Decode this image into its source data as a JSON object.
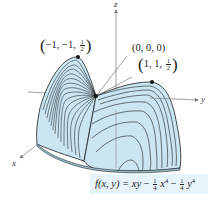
{
  "figure": {
    "type": "3d-surface",
    "surface_fill": "#c9e6f2",
    "contour_color": "#1c1c1c",
    "axis_color": "#777777",
    "axes": {
      "x_label": "x",
      "y_label": "y",
      "z_label": "z"
    },
    "points": [
      {
        "name": "max-left",
        "coords": [
          "−1",
          "−1"
        ],
        "z_num": "1",
        "z_den": "2"
      },
      {
        "name": "origin",
        "label": "(0, 0, 0)"
      },
      {
        "name": "max-right",
        "coords": [
          "1",
          "1"
        ],
        "z_num": "1",
        "z_den": "2"
      }
    ],
    "formula": {
      "lhs": "f(x, y) = ",
      "term1": "xy",
      "minus": " − ",
      "coef_num": "1",
      "coef_den": "4",
      "term2_var": "x",
      "term3_var": "y",
      "exponent": "4"
    }
  }
}
